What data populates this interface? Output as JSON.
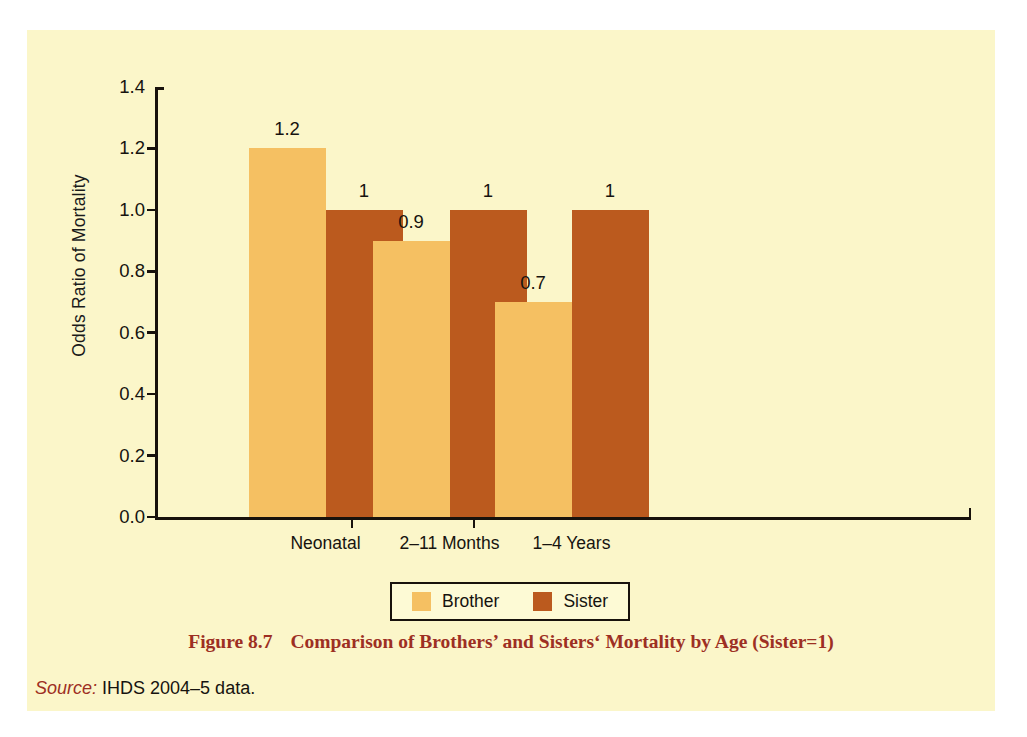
{
  "figure": {
    "caption_number": "Figure 8.7",
    "caption_text": "Comparison of Brothers’ and Sisters‘ Mortality by Age (Sister=1)",
    "source_label": "Source:",
    "source_text": " IHDS 2004–5 data."
  },
  "colors": {
    "panel_background": "#FBF6C9",
    "brother": "#F5C062",
    "sister": "#BB5A1E",
    "axis": "#18120C",
    "caption": "#9D2F23",
    "text": "#16130F"
  },
  "chart_data": {
    "type": "bar",
    "title": "",
    "xlabel": "",
    "ylabel": "Odds Ratio of Mortality",
    "categories": [
      "Neonatal",
      "2–11 Months",
      "1–4 Years"
    ],
    "series": [
      {
        "name": "Brother",
        "values": [
          1.2,
          0.9,
          0.7
        ],
        "labels": [
          "1.2",
          "0.9",
          "0.7"
        ],
        "color": "#F5C062"
      },
      {
        "name": "Sister",
        "values": [
          1.0,
          1.0,
          1.0
        ],
        "labels": [
          "1",
          "1",
          "1"
        ],
        "color": "#BB5A1E"
      }
    ],
    "ylim": [
      0.0,
      1.4
    ],
    "ytick_values": [
      1.4,
      1.2,
      1.0,
      0.8,
      0.6,
      0.4,
      0.2,
      0.0
    ],
    "ytick_labels": [
      "1.4",
      "1.2",
      "1.0",
      "0.8",
      "0.6",
      "0.4",
      "0.2",
      "0.0"
    ],
    "grid": false,
    "legend_position": "bottom-center",
    "legend_entries": [
      "Brother",
      "Sister"
    ]
  }
}
